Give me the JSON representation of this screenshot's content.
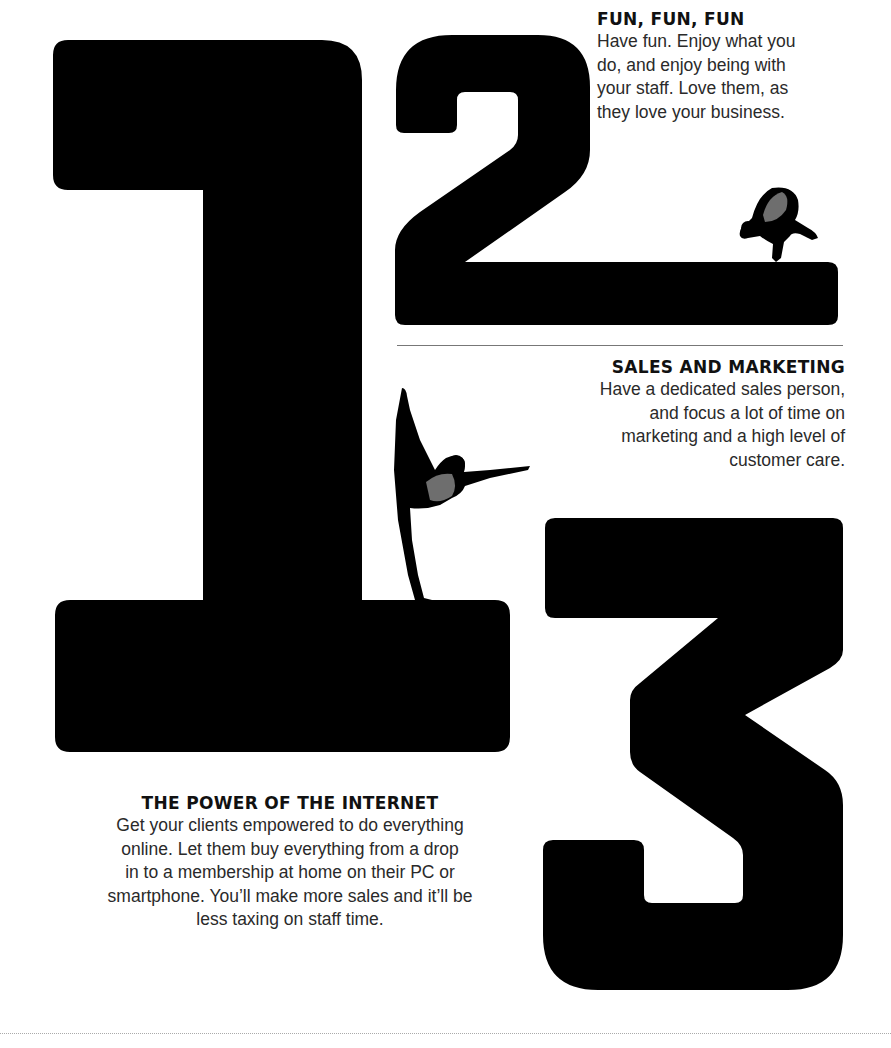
{
  "numerals": [
    {
      "digit": "1",
      "color": "#000000"
    },
    {
      "digit": "2",
      "color": "#000000"
    },
    {
      "digit": "3",
      "color": "#000000"
    }
  ],
  "illustrations": {
    "crow_pose": {
      "accent": "#6e6e6e"
    },
    "dancer_pose": {
      "accent": "#6e6e6e"
    }
  },
  "sections": {
    "fun": {
      "heading": "FUN, FUN, FUN",
      "lines": [
        "Have fun. Enjoy what you",
        "do, and enjoy being with",
        "your staff. Love them, as",
        "they love your business."
      ]
    },
    "sales": {
      "heading": "SALES AND MARKETING",
      "lines": [
        "Have a dedicated sales person,",
        "and focus a lot of time on",
        "marketing and a high level of",
        "customer care."
      ]
    },
    "internet": {
      "heading": "THE POWER OF THE INTERNET",
      "lines": [
        "Get your clients empowered to do everything",
        "online. Let them buy everything from a drop",
        "in to a membership at home on their PC or",
        "smartphone. You’ll make more sales and it’ll be",
        "less taxing on staff time."
      ]
    }
  }
}
